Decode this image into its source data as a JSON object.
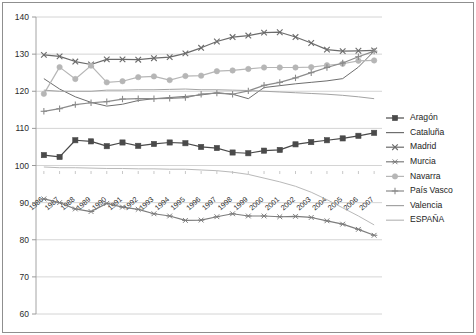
{
  "chart_data": {
    "type": "line",
    "title": "",
    "subtitle": "",
    "xlabel": "",
    "ylabel": "",
    "grid": true,
    "legend_position": "right",
    "ylim": [
      60,
      140
    ],
    "yticks": [
      60,
      70,
      80,
      90,
      100,
      110,
      120,
      130,
      140
    ],
    "categories": [
      "1986",
      "1987",
      "1988",
      "1989",
      "1990",
      "1991",
      "1992",
      "1993",
      "1994",
      "1995",
      "1996",
      "1997",
      "1998",
      "1999",
      "2000",
      "2001",
      "2002",
      "2003",
      "2004",
      "2005",
      "2006",
      "2007"
    ],
    "x": [
      1986,
      1987,
      1988,
      1989,
      1990,
      1991,
      1992,
      1993,
      1994,
      1995,
      1996,
      1997,
      1998,
      1999,
      2000,
      2001,
      2002,
      2003,
      2004,
      2005,
      2006,
      2007
    ],
    "series": [
      {
        "name": "Aragón",
        "marker": "square",
        "color": "#4a4a4a",
        "values": [
          102.8,
          102.3,
          106.8,
          106.5,
          105.2,
          106.2,
          105.3,
          105.8,
          106.2,
          106.0,
          105.0,
          104.7,
          103.5,
          103.3,
          104.0,
          104.2,
          105.7,
          106.3,
          106.8,
          107.3,
          108.0,
          108.8
        ]
      },
      {
        "name": "Cataluña",
        "marker": "none",
        "color": "#6e6e6e",
        "values": [
          123.4,
          120.6,
          118.5,
          117.0,
          116.0,
          116.5,
          117.5,
          118.0,
          118.3,
          118.6,
          119.0,
          119.6,
          119.2,
          118.0,
          121.0,
          121.5,
          122.0,
          122.4,
          122.8,
          123.4,
          126.5,
          130.8
        ]
      },
      {
        "name": "Madrid",
        "marker": "x",
        "color": "#6b6b6b",
        "values": [
          129.8,
          129.4,
          128.0,
          127.2,
          128.6,
          128.6,
          128.5,
          128.9,
          129.2,
          130.2,
          131.7,
          133.4,
          134.6,
          135.0,
          135.8,
          135.9,
          134.6,
          133.0,
          131.2,
          130.8,
          130.9,
          131.0
        ]
      },
      {
        "name": "Murcia",
        "marker": "star",
        "color": "#7d7d7d",
        "values": [
          91.0,
          90.0,
          88.3,
          87.6,
          89.8,
          88.8,
          88.2,
          87.0,
          86.4,
          85.2,
          85.3,
          86.2,
          87.0,
          86.4,
          86.4,
          86.2,
          86.3,
          86.0,
          85.1,
          84.2,
          82.8,
          81.2
        ]
      },
      {
        "name": "Navarra",
        "marker": "circle",
        "color": "#b6b6b6",
        "values": [
          119.3,
          126.5,
          123.3,
          126.9,
          122.4,
          122.7,
          123.8,
          124.0,
          123.0,
          124.1,
          124.2,
          125.4,
          125.6,
          126.0,
          126.4,
          126.4,
          126.4,
          126.5,
          127.0,
          127.4,
          128.2,
          128.3
        ]
      },
      {
        "name": "País Vasco",
        "marker": "plus",
        "color": "#8b8b8b",
        "values": [
          114.6,
          115.3,
          116.4,
          116.9,
          117.2,
          117.9,
          118.0,
          118.0,
          118.1,
          118.3,
          119.2,
          119.5,
          119.2,
          120.1,
          121.6,
          122.4,
          123.6,
          125.0,
          126.4,
          127.6,
          129.3,
          130.8
        ]
      },
      {
        "name": "Valencia",
        "marker": "none",
        "color": "#a3a3a3",
        "values": [
          120.3,
          120.0,
          120.0,
          120.0,
          120.3,
          120.3,
          120.4,
          120.4,
          120.5,
          120.6,
          120.4,
          120.4,
          120.3,
          120.2,
          120.0,
          119.8,
          119.6,
          119.4,
          119.2,
          118.9,
          118.5,
          118.0
        ]
      },
      {
        "name": "ESPAÑA",
        "marker": "none",
        "color": "#b9b9b9",
        "values": [
          99.6,
          99.4,
          99.4,
          99.3,
          99.2,
          99.2,
          99.1,
          99.1,
          99.0,
          99.0,
          98.8,
          98.6,
          98.2,
          97.6,
          96.6,
          95.6,
          94.4,
          92.8,
          90.8,
          88.6,
          86.4,
          84.0
        ]
      }
    ]
  },
  "legend": {
    "items": [
      {
        "label": "Aragón"
      },
      {
        "label": "Cataluña"
      },
      {
        "label": "Madrid"
      },
      {
        "label": "Murcia"
      },
      {
        "label": "Navarra"
      },
      {
        "label": "País Vasco"
      },
      {
        "label": "Valencia"
      },
      {
        "label": "ESPAÑA"
      }
    ]
  }
}
